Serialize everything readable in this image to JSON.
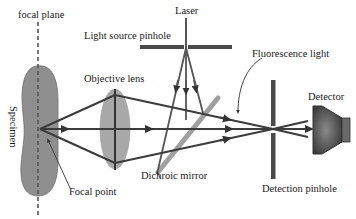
{
  "labels": {
    "focal_plane": "focal plane",
    "laser": "Laser",
    "light_source_pinhole": "Light source pinhole",
    "objective_lens": "Objective lens",
    "fluorescence_light": "Fluorescence light",
    "detector": "Detector",
    "specimen": "Specimen",
    "focal_point": "Focal point",
    "dichroic_mirror": "Dichroic mirror",
    "detection_pinhole": "Detection pinhole"
  },
  "colors": {
    "beam": "#3c3c3c",
    "specimen_fill": "#8f8f8f",
    "lens_fill": "#a8a8a8",
    "mirror": "#9a9a9a",
    "pinhole": "#4a4a4a",
    "detector": "#5a5a5a",
    "text": "#1a1a1a"
  }
}
